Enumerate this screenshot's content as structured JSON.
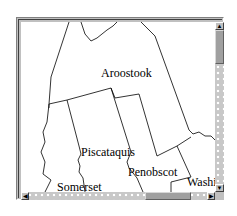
{
  "map": {
    "region": "Maine counties",
    "labels": {
      "aroostook": "Aroostook",
      "piscataquis": "Piscataquis",
      "penobscot": "Penobscot",
      "somerset": "Somerset",
      "washington": "Washin"
    }
  },
  "scrollbars": {
    "vertical": {
      "up_arrow": "▲",
      "down_arrow": "▼",
      "thumb_position": "top"
    },
    "horizontal": {
      "left_arrow": "◀",
      "right_arrow": "▶",
      "thumb_position": "right-of-center"
    }
  },
  "colors": {
    "map_background": "#ffffff",
    "border_lines": "#000000",
    "frame": "#c0c0c0",
    "scroll_track": "#c8c8c8",
    "scroll_thumb": "#a0a0a0"
  }
}
